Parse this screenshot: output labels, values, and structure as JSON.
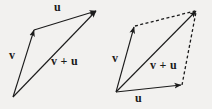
{
  "figure": {
    "background_color": "#f2f1ef",
    "stroke_color": "#1b1b1b",
    "label_color": "#1b1b1b",
    "width": 212,
    "height": 109
  },
  "left_diagram": {
    "name": "triangle-rule",
    "labels": {
      "u": "u",
      "v": "v",
      "sum": "v + u"
    },
    "vectors": [
      {
        "name": "v",
        "label": "v",
        "from": [
          13,
          97
        ],
        "to": [
          34,
          30
        ],
        "style": "solid",
        "arrow": true
      },
      {
        "name": "u",
        "label": "u",
        "from": [
          34,
          30
        ],
        "to": [
          96,
          11
        ],
        "style": "solid",
        "arrow": true
      },
      {
        "name": "v-plus-u",
        "label": "v + u",
        "from": [
          13,
          97
        ],
        "to": [
          96,
          11
        ],
        "style": "solid",
        "arrow": true
      }
    ]
  },
  "right_diagram": {
    "name": "parallelogram-rule",
    "labels": {
      "u": "u",
      "v": "v",
      "sum": "v + u"
    },
    "vectors": [
      {
        "name": "v",
        "label": "v",
        "from": [
          116,
          92
        ],
        "to": [
          134,
          27
        ],
        "style": "solid",
        "arrow": true
      },
      {
        "name": "u",
        "label": "u",
        "from": [
          116,
          92
        ],
        "to": [
          181,
          85
        ],
        "style": "solid",
        "arrow": true
      },
      {
        "name": "v-plus-u",
        "label": "v + u",
        "from": [
          116,
          92
        ],
        "to": [
          196,
          11
        ],
        "style": "solid",
        "arrow": true
      },
      {
        "name": "dashed-top",
        "label": "",
        "from": [
          135,
          26
        ],
        "to": [
          195,
          11
        ],
        "style": "dashed",
        "arrow": false
      },
      {
        "name": "dashed-right",
        "label": "",
        "from": [
          182,
          85
        ],
        "to": [
          196,
          12
        ],
        "style": "dashed",
        "arrow": false
      }
    ]
  }
}
